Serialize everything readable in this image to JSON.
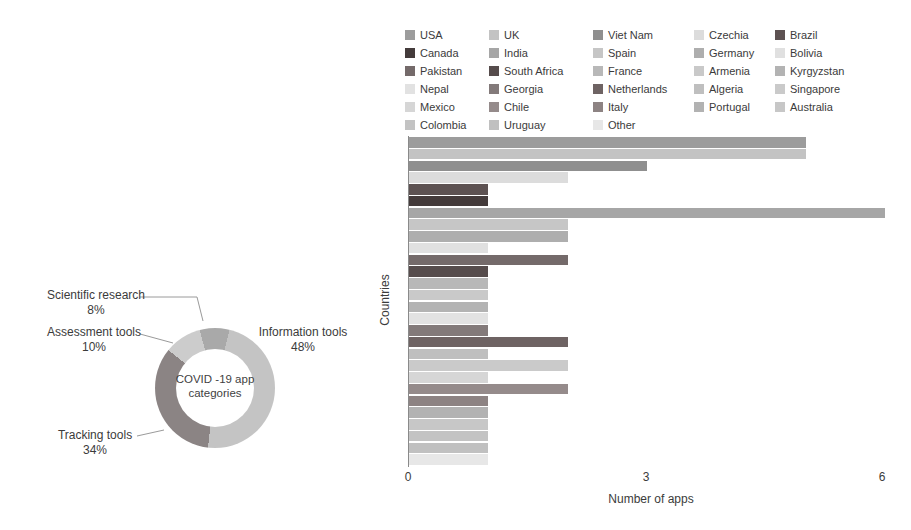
{
  "chart_data": [
    {
      "type": "pie",
      "donut": true,
      "title": "COVID -19 app categories",
      "center_label_lines": [
        "COVID -19 app",
        "categories"
      ],
      "start_angle_deg": 14,
      "direction": "clockwise",
      "slices": [
        {
          "label": "Information tools",
          "pct_label": "48%",
          "value": 48,
          "color": "#c4c4c4"
        },
        {
          "label": "Tracking tools",
          "pct_label": "34%",
          "value": 34,
          "color": "#8b8484"
        },
        {
          "label": "Assessment tools",
          "pct_label": "10%",
          "value": 10,
          "color": "#cccccc"
        },
        {
          "label": "Scientific research",
          "pct_label": "8%",
          "value": 8,
          "color": "#a9a9a9"
        }
      ]
    },
    {
      "type": "bar",
      "orientation": "horizontal",
      "xlabel": "Number of apps",
      "ylabel": "Countries",
      "xlim": [
        0,
        6
      ],
      "xticks": [
        "0",
        "3",
        "6"
      ],
      "grid": false,
      "legend_position": "top",
      "legend_columns": 5,
      "countries": [
        {
          "name": "USA",
          "value": 5,
          "color": "#9c9c9c"
        },
        {
          "name": "UK",
          "value": 5,
          "color": "#c3c3c3"
        },
        {
          "name": "Viet Nam",
          "value": 3,
          "color": "#8f8f8f"
        },
        {
          "name": "Czechia",
          "value": 2,
          "color": "#dcdcdc"
        },
        {
          "name": "Brazil",
          "value": 1,
          "color": "#5d5252"
        },
        {
          "name": "Canada",
          "value": 1,
          "color": "#443b3b"
        },
        {
          "name": "India",
          "value": 6,
          "color": "#a6a6a6"
        },
        {
          "name": "Spain",
          "value": 2,
          "color": "#c6c6c6"
        },
        {
          "name": "Germany",
          "value": 2,
          "color": "#aeaeae"
        },
        {
          "name": "Bolivia",
          "value": 1,
          "color": "#e0e0e0"
        },
        {
          "name": "Pakistan",
          "value": 2,
          "color": "#746a6a"
        },
        {
          "name": "South Africa",
          "value": 1,
          "color": "#564c4c"
        },
        {
          "name": "France",
          "value": 1,
          "color": "#b8b8b8"
        },
        {
          "name": "Armenia",
          "value": 1,
          "color": "#c9c9c9"
        },
        {
          "name": "Kyrgyzstan",
          "value": 1,
          "color": "#b3b3b3"
        },
        {
          "name": "Nepal",
          "value": 1,
          "color": "#e2e2e2"
        },
        {
          "name": "Georgia",
          "value": 1,
          "color": "#837a7a"
        },
        {
          "name": "Netherlands",
          "value": 2,
          "color": "#6e6363"
        },
        {
          "name": "Algeria",
          "value": 1,
          "color": "#bfbfbf"
        },
        {
          "name": "Singapore",
          "value": 2,
          "color": "#cacaca"
        },
        {
          "name": "Mexico",
          "value": 1,
          "color": "#d6d6d6"
        },
        {
          "name": "Chile",
          "value": 2,
          "color": "#958b8b"
        },
        {
          "name": "Italy",
          "value": 1,
          "color": "#8d8383"
        },
        {
          "name": "Portugal",
          "value": 1,
          "color": "#b2b2b2"
        },
        {
          "name": "Australia",
          "value": 1,
          "color": "#c7c7c7"
        },
        {
          "name": "Colombia",
          "value": 1,
          "color": "#c3c3c3"
        },
        {
          "name": "Uruguay",
          "value": 1,
          "color": "#c0c0c0"
        },
        {
          "name": "Other",
          "value": 1,
          "color": "#e7e7e7"
        }
      ]
    }
  ]
}
